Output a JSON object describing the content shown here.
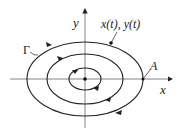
{
  "diagram": {
    "type": "phase-plane-orbits",
    "axes": {
      "x_label": "x",
      "y_label": "y"
    },
    "labels": {
      "curve": "Γ",
      "point_A": "A",
      "trajectory": "x(t), y(t)"
    },
    "orbits": [
      {
        "name": "inner",
        "rx": 18,
        "ry": 11
      },
      {
        "name": "middle",
        "rx": 38,
        "ry": 25
      },
      {
        "name": "outer",
        "rx": 58,
        "ry": 37
      }
    ],
    "center": {
      "x": 85,
      "y": 79
    },
    "direction": "clockwise",
    "colors": {
      "stroke": "#222222",
      "axis": "#777777"
    }
  }
}
